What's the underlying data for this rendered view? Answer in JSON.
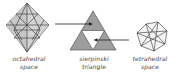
{
  "diagram": {
    "nodes": [
      {
        "id": "octahedral",
        "shape": "octahedron-icon",
        "label_line1": "octahedral",
        "label_line2": "space"
      },
      {
        "id": "sierpinski",
        "shape": "sierpinski-triangle-icon",
        "label_line1": "sierpinski",
        "label_line2": "triangle"
      },
      {
        "id": "tetrahedral",
        "shape": "tetrahedral-polyhedron-icon",
        "label_line1": "tetrahedral",
        "label_line2": "space"
      }
    ],
    "edges": [
      {
        "from": "octahedral",
        "to": "sierpinski",
        "target": "top sub-triangle"
      },
      {
        "from": "tetrahedral",
        "to": "sierpinski",
        "target": "central inverted triangle"
      }
    ],
    "colors": {
      "fill": "#a9a9a9",
      "fill_light": "#d4d4d4",
      "stroke": "#333333",
      "background": "#ffffff"
    }
  }
}
